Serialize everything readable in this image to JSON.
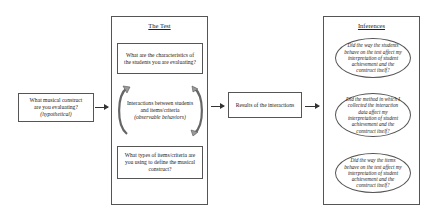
{
  "construct_box": {
    "line1": "What musical construct",
    "line2": "are you evaluating?",
    "line3": "(hypothetical)"
  },
  "test_panel": {
    "title": "The Test",
    "top_question": "What are the characteristics of the students you are evaluating?",
    "interaction_line1": "Interactions between students",
    "interaction_line2": "and items/criteria",
    "interaction_line3": "(observable behaviors)",
    "bottom_question": "What types of items/criteria are you using to define the musical construct?"
  },
  "results_box": {
    "label": "Results of the interactions"
  },
  "inferences_panel": {
    "title": "Inferences",
    "items": [
      "Did the way the students behave on the test affect my interpretation of student achievement and the construct itself?",
      "Did the method in which I collected the interaction data affect my interpretation of student achievement and the construct itself?",
      "Did the way the items behave on the test affect my interpretation of student achievement and the construct itself?"
    ]
  },
  "colors": {
    "line": "#555555",
    "arrow": "#333333",
    "curve_arrow_fill": "#9a9a9a"
  }
}
